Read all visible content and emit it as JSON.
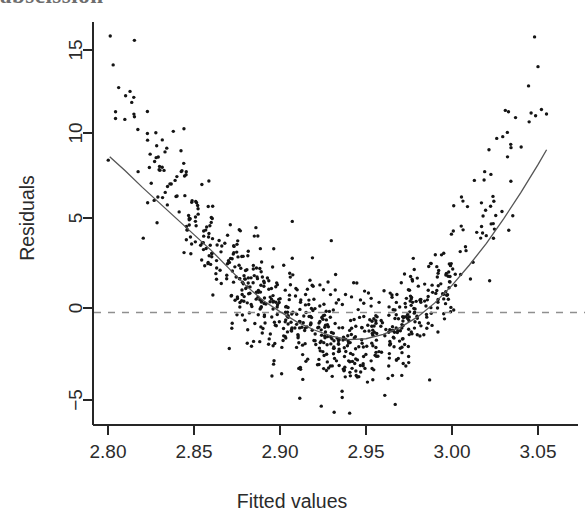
{
  "page_bleed": {
    "text": "abscission"
  },
  "figure": {
    "name": "residuals-vs-fitted-plot",
    "background_color": "#ffffff"
  },
  "chart_data": {
    "type": "scatter",
    "title": "",
    "xlabel": "Fitted values",
    "ylabel": "Residuals",
    "xlim": [
      2.7965,
      3.0605
    ],
    "ylim": [
      -6.2,
      16.6
    ],
    "grid": false,
    "legend": null,
    "point_color": "#141414",
    "point_radius": 1.7,
    "n_points": 760,
    "x_ticks": [
      2.8,
      2.85,
      2.9,
      2.95,
      3.0,
      3.05
    ],
    "x_tick_labels": [
      "2.80",
      "2.85",
      "2.90",
      "2.95",
      "3.00",
      "3.05"
    ],
    "y_ticks": [
      -5,
      0,
      5,
      10,
      15
    ],
    "y_tick_labels": [
      "-5",
      "0",
      "5",
      "10",
      "15"
    ],
    "reference_line": {
      "name": "zero-residual-line",
      "y": 0,
      "style": "dashed",
      "color": "#8f8f8f"
    },
    "smooth_curve": {
      "name": "lowess-smoother",
      "color": "#555555",
      "x": [
        2.801,
        2.81,
        2.82,
        2.83,
        2.84,
        2.85,
        2.86,
        2.87,
        2.88,
        2.89,
        2.9,
        2.91,
        2.92,
        2.93,
        2.94,
        2.95,
        2.96,
        2.97,
        2.98,
        2.99,
        3.0,
        3.01,
        3.02,
        3.03,
        3.04,
        3.05,
        3.055
      ],
      "y": [
        8.9,
        8.1,
        7.15,
        6.25,
        5.35,
        4.45,
        3.55,
        2.55,
        1.55,
        0.7,
        0.05,
        -0.55,
        -1.0,
        -1.35,
        -1.55,
        -1.5,
        -1.25,
        -0.85,
        -0.25,
        0.55,
        1.55,
        2.7,
        3.95,
        5.35,
        6.85,
        8.45,
        9.3
      ]
    },
    "scatter_model": {
      "description": "Points drawn from a U-shaped residual band; mean follows the lowess curve, spread widens toward the centre and the tails carry positive outliers.",
      "seed": 20240513,
      "density_segments": [
        {
          "x0": 2.798,
          "x1": 2.82,
          "n": 12,
          "mean_offset": 4.6,
          "sd": 2.4
        },
        {
          "x0": 2.82,
          "x1": 2.845,
          "n": 34,
          "mean_offset": 1.3,
          "sd": 1.5
        },
        {
          "x0": 2.845,
          "x1": 2.87,
          "n": 68,
          "mean_offset": 0.35,
          "sd": 1.1
        },
        {
          "x0": 2.87,
          "x1": 2.895,
          "n": 118,
          "mean_offset": -0.1,
          "sd": 1.35
        },
        {
          "x0": 2.895,
          "x1": 2.925,
          "n": 138,
          "mean_offset": -0.2,
          "sd": 1.45
        },
        {
          "x0": 2.925,
          "x1": 2.955,
          "n": 150,
          "mean_offset": -0.2,
          "sd": 1.45
        },
        {
          "x0": 2.955,
          "x1": 2.98,
          "n": 118,
          "mean_offset": -0.1,
          "sd": 1.3
        },
        {
          "x0": 2.98,
          "x1": 3.0,
          "n": 66,
          "mean_offset": 0.3,
          "sd": 1.1
        },
        {
          "x0": 3.0,
          "x1": 3.025,
          "n": 32,
          "mean_offset": 1.3,
          "sd": 1.5
        },
        {
          "x0": 3.025,
          "x1": 3.056,
          "n": 14,
          "mean_offset": 3.1,
          "sd": 2.3
        }
      ],
      "outliers": [
        {
          "x": 2.8013,
          "y": 15.8
        },
        {
          "x": 2.803,
          "y": 14.15
        },
        {
          "x": 2.8062,
          "y": 12.85
        },
        {
          "x": 2.823,
          "y": 9.85
        },
        {
          "x": 2.8245,
          "y": 9.05
        },
        {
          "x": 2.828,
          "y": 8.85
        },
        {
          "x": 2.8315,
          "y": 8.3
        },
        {
          "x": 2.836,
          "y": 7.35
        },
        {
          "x": 2.839,
          "y": 7.55
        },
        {
          "x": 2.843,
          "y": 8.1
        },
        {
          "x": 2.8455,
          "y": 8.05
        },
        {
          "x": 2.8175,
          "y": 8.05
        },
        {
          "x": 2.8205,
          "y": 4.25
        },
        {
          "x": 2.829,
          "y": 6.6
        },
        {
          "x": 2.8345,
          "y": 6.15
        },
        {
          "x": 2.851,
          "y": 6.35
        },
        {
          "x": 2.86,
          "y": 5.15
        },
        {
          "x": 2.886,
          "y": 4.85
        },
        {
          "x": 3.001,
          "y": 6.1
        },
        {
          "x": 3.0055,
          "y": 6.6
        },
        {
          "x": 3.009,
          "y": 6.05
        },
        {
          "x": 3.013,
          "y": 7.55
        },
        {
          "x": 3.019,
          "y": 8.05
        },
        {
          "x": 3.0215,
          "y": 9.3
        },
        {
          "x": 3.026,
          "y": 9.95
        },
        {
          "x": 3.0295,
          "y": 10.05
        },
        {
          "x": 3.031,
          "y": 11.55
        },
        {
          "x": 3.033,
          "y": 4.7
        },
        {
          "x": 3.0445,
          "y": 12.95
        },
        {
          "x": 3.046,
          "y": 11.4
        },
        {
          "x": 3.048,
          "y": 15.75
        },
        {
          "x": 3.05,
          "y": 14.05
        },
        {
          "x": 3.052,
          "y": 11.6
        },
        {
          "x": 2.967,
          "y": -5.25
        },
        {
          "x": 2.9405,
          "y": -5.75
        },
        {
          "x": 2.924,
          "y": -5.35
        },
        {
          "x": 2.9115,
          "y": -4.9
        },
        {
          "x": 2.987,
          "y": -3.85
        }
      ]
    }
  },
  "axes_geometry": {
    "plot_left_px": 93,
    "plot_right_px": 578,
    "plot_top_px": 22,
    "plot_bottom_px": 425,
    "x_tick_px": [
      108,
      194,
      280,
      366,
      452,
      538
    ],
    "y_tick_px": [
      400,
      308,
      218,
      133,
      50
    ]
  }
}
